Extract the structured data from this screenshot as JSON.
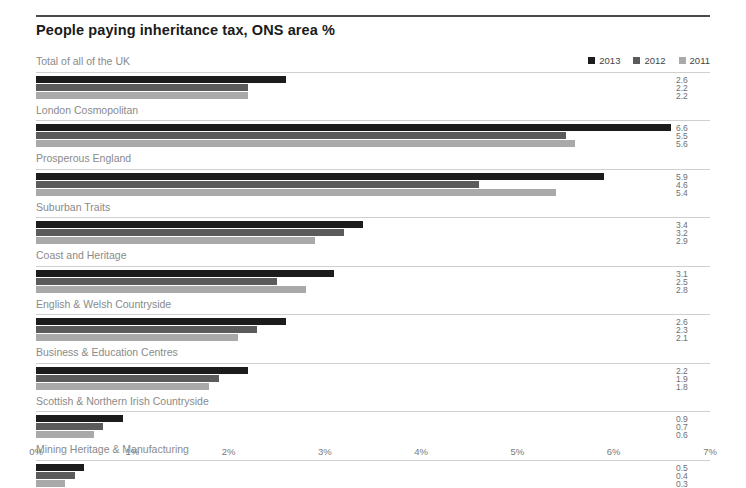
{
  "chart_data": {
    "type": "bar",
    "title": "People paying inheritance tax, ONS area %",
    "xlabel": "",
    "ylabel": "",
    "orientation": "horizontal",
    "grid": false,
    "legend_position": "top-right",
    "xlim": [
      0,
      7
    ],
    "xticks": [
      "0%",
      "1%",
      "2%",
      "3%",
      "4%",
      "5%",
      "6%",
      "7%"
    ],
    "xtick_values": [
      0,
      1,
      2,
      3,
      4,
      5,
      6,
      7
    ],
    "categories": [
      "Total of all of the UK",
      "London Cosmopolitan",
      "Prosperous England",
      "Suburban Traits",
      "Coast and Heritage",
      "English & Welsh Countryside",
      "Business & Education Centres",
      "Scottish & Northern Irish Countryside",
      "Mining Heritage & Manufacturing"
    ],
    "series": [
      {
        "name": "2013",
        "color": "#1c1c1c",
        "values": [
          2.6,
          6.6,
          5.9,
          3.4,
          3.1,
          2.6,
          2.2,
          0.9,
          0.5
        ]
      },
      {
        "name": "2012",
        "color": "#5b5b5b",
        "values": [
          2.2,
          5.5,
          4.6,
          3.2,
          2.5,
          2.3,
          1.9,
          0.7,
          0.4
        ]
      },
      {
        "name": "2011",
        "color": "#a9a9a9",
        "values": [
          2.2,
          5.6,
          5.4,
          2.9,
          2.8,
          2.1,
          1.8,
          0.6,
          0.3
        ]
      }
    ]
  }
}
